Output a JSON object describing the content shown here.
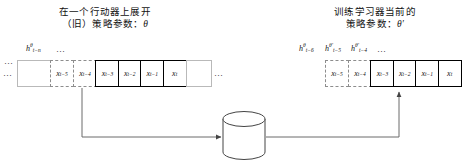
{
  "figure": {
    "background": "#ffffff",
    "line_color": "#555555",
    "bold_border_color": "#000000",
    "plain_border_color": "#b9b9b9",
    "dashed_border_color": "#8d8d8d"
  },
  "left_group": {
    "caption_line1": "在一个行动器上展开",
    "caption_line2": "（旧）策略参数：",
    "caption_param": "θ",
    "leading_dots": "…",
    "trailing_dots": "…",
    "hidden_state_dots": "…",
    "hidden_state": {
      "base": "h",
      "sup": "θ",
      "sub": "t−n"
    },
    "cells": [
      {
        "label": "",
        "style": "plain",
        "width": 34
      },
      {
        "label": "x",
        "sub": "t−5",
        "style": "dashed",
        "width": 24
      },
      {
        "label": "x",
        "sub": "t−4",
        "style": "dashed",
        "width": 24
      },
      {
        "label": "x",
        "sub": "t−3",
        "style": "bold",
        "width": 24
      },
      {
        "label": "x",
        "sub": "t−2",
        "style": "bold",
        "width": 24
      },
      {
        "label": "x",
        "sub": "t−1",
        "style": "bold",
        "width": 24
      },
      {
        "label": "x",
        "sub": "t",
        "style": "bold",
        "width": 24
      },
      {
        "label": "",
        "style": "plain",
        "width": 26
      }
    ]
  },
  "right_group": {
    "caption_line1": "训练学习器当前的",
    "caption_line2": "策略参数：",
    "caption_param": "θ′",
    "hidden_state_dots": "…",
    "hidden_states": [
      {
        "base": "h",
        "sup": "θ",
        "sub": "t−6"
      },
      {
        "base": "h",
        "sup": "θ′",
        "sub": "t−5"
      },
      {
        "base": "h",
        "sup": "θ′",
        "sub": "t−4"
      }
    ],
    "cells": [
      {
        "label": "x",
        "sub": "t−5",
        "style": "dashed",
        "width": 24
      },
      {
        "label": "x",
        "sub": "t−4",
        "style": "dashed",
        "width": 24
      },
      {
        "label": "x",
        "sub": "t−3",
        "style": "bold",
        "width": 24
      },
      {
        "label": "x",
        "sub": "t−2",
        "style": "bold",
        "width": 24
      },
      {
        "label": "x",
        "sub": "t−1",
        "style": "bold",
        "width": 24
      },
      {
        "label": "x",
        "sub": "t",
        "style": "bold",
        "width": 24
      }
    ]
  },
  "datastore": {
    "name": "experience-buffer-cylinder",
    "label": ""
  }
}
